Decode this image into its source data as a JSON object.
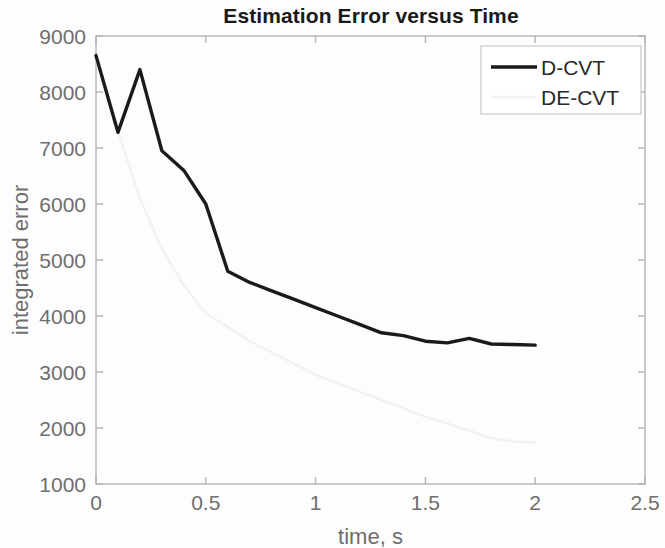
{
  "chart_data": {
    "type": "line",
    "title": "Estimation Error versus Time",
    "xlabel": "time, s",
    "ylabel": "integrated error",
    "xlim": [
      0,
      2.5
    ],
    "ylim": [
      1000,
      9000
    ],
    "xticks": [
      "0",
      "0.5",
      "1",
      "1.5",
      "2",
      "2.5"
    ],
    "xtick_values": [
      0,
      0.5,
      1,
      1.5,
      2,
      2.5
    ],
    "yticks": [
      "1000",
      "2000",
      "3000",
      "4000",
      "5000",
      "6000",
      "7000",
      "8000",
      "9000"
    ],
    "ytick_values": [
      1000,
      2000,
      3000,
      4000,
      5000,
      6000,
      7000,
      8000,
      9000
    ],
    "grid": false,
    "legend_position": "top-right",
    "series": [
      {
        "name": "D-CVT",
        "color": "#1a1a1a",
        "style": "solid",
        "width": 3.4,
        "x": [
          0,
          0.1,
          0.2,
          0.3,
          0.4,
          0.5,
          0.6,
          0.7,
          0.8,
          0.9,
          1.0,
          1.1,
          1.2,
          1.3,
          1.4,
          1.5,
          1.6,
          1.7,
          1.8,
          1.9,
          2.0
        ],
        "y": [
          8650,
          7280,
          8400,
          6950,
          6600,
          6000,
          4800,
          4600,
          4450,
          4300,
          4150,
          4000,
          3850,
          3700,
          3650,
          3550,
          3520,
          3600,
          3500,
          3490,
          3480
        ]
      },
      {
        "name": "DE-CVT",
        "color": "#f2f2f2",
        "style": "solid",
        "width": 2.6,
        "x": [
          0,
          0.1,
          0.2,
          0.3,
          0.4,
          0.5,
          0.6,
          0.7,
          0.8,
          0.9,
          1.0,
          1.1,
          1.2,
          1.3,
          1.4,
          1.5,
          1.6,
          1.7,
          1.8,
          1.9,
          2.0
        ],
        "y": [
          8600,
          7300,
          6100,
          5200,
          4550,
          4050,
          3800,
          3550,
          3350,
          3150,
          2950,
          2800,
          2650,
          2500,
          2350,
          2200,
          2080,
          1950,
          1820,
          1760,
          1740
        ]
      }
    ]
  },
  "legend": {
    "items": [
      {
        "label": "D-CVT"
      },
      {
        "label": "DE-CVT"
      }
    ]
  },
  "colors": {
    "axis": "#b4b4b4",
    "tick_text": "#6e6e6e",
    "title": "#1a1a1a",
    "series_primary": "#1a1a1a",
    "series_secondary": "#f2f2f2",
    "background": "#fdfdfd"
  }
}
